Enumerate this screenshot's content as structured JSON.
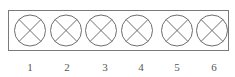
{
  "diagram": {
    "type": "row-of-lamp-symbols",
    "symbol": "lamp-icon",
    "stroke_color": "#6e6e6e",
    "frame_color": "#7a7a7a",
    "label_color": "#555555",
    "items": [
      {
        "label": "1",
        "cx": 30
      },
      {
        "label": "2",
        "cx": 66
      },
      {
        "label": "3",
        "cx": 101
      },
      {
        "label": "4",
        "cx": 137
      },
      {
        "label": "5",
        "cx": 177
      },
      {
        "label": "6",
        "cx": 212
      }
    ]
  }
}
